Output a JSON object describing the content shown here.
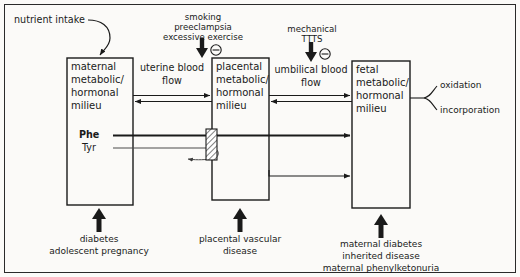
{
  "figure": {
    "type": "flow-diagram",
    "background": "#fbfaf8",
    "stroke": "#1a1a1a"
  },
  "boxes": [
    {
      "id": "maternal",
      "lines": [
        "maternal",
        "metabolic/",
        "hormonal",
        "milieu"
      ],
      "x": 67,
      "y": 58,
      "w": 66,
      "h": 147
    },
    {
      "id": "placental",
      "lines": [
        "placental",
        "metabolic/",
        "hormonal",
        "milieu"
      ],
      "x": 212,
      "y": 58,
      "w": 57,
      "h": 142
    },
    {
      "id": "fetal",
      "lines": [
        "fetal",
        "metabolic/",
        "hormonal",
        "milieu"
      ],
      "x": 352,
      "y": 61,
      "w": 58,
      "h": 147
    }
  ],
  "box_labels": {
    "maternal": {
      "l1": "maternal",
      "l2": "metabolic/",
      "l3": "hormonal",
      "l4": "milieu"
    },
    "placental": {
      "l1": "placental",
      "l2": "metabolic/",
      "l3": "hormonal",
      "l4": "milieu"
    },
    "fetal": {
      "l1": "fetal",
      "l2": "metabolic/",
      "l3": "hormonal",
      "l4": "milieu"
    }
  },
  "top_annotations": [
    {
      "id": "uterine",
      "cause_lines": [
        "smoking",
        "preeclampsia",
        "excessive exercise"
      ],
      "flow_lines": [
        "uterine blood",
        "flow"
      ],
      "sign": "minus"
    },
    {
      "id": "umbilical",
      "cause_lines": [
        "mechanical",
        "TTTS"
      ],
      "flow_lines": [
        "umbilical blood",
        "flow"
      ],
      "sign": "minus"
    }
  ],
  "annotation_text": {
    "uterine": {
      "c1": "smoking",
      "c2": "preeclampsia",
      "c3": "excessive exercise",
      "f1": "uterine blood",
      "f2": "flow"
    },
    "umbilical": {
      "c1": "mechanical",
      "c2": "TTTS",
      "f1": "umbilical blood",
      "f2": "flow"
    }
  },
  "inputs": {
    "nutrient_intake": "nutrient intake"
  },
  "transport": {
    "phe": "Phe",
    "tyr": "Tyr"
  },
  "outputs": {
    "oxidation": "oxidation",
    "incorporation": "incorporation"
  },
  "captions": [
    {
      "id": "maternal-caption",
      "lines": [
        "diabetes",
        "adolescent pregnancy"
      ]
    },
    {
      "id": "placental-caption",
      "lines": [
        "placental vascular",
        "disease"
      ]
    },
    {
      "id": "fetal-caption",
      "lines": [
        "maternal diabetes",
        "inherited disease",
        "maternal phenylketonuria"
      ]
    }
  ],
  "caption_text": {
    "maternal": {
      "l1": "diabetes",
      "l2": "adolescent pregnancy"
    },
    "placental": {
      "l1": "placental vascular",
      "l2": "disease"
    },
    "fetal": {
      "l1": "maternal diabetes",
      "l2": "inherited disease",
      "l3": "maternal phenylketonuria"
    }
  }
}
